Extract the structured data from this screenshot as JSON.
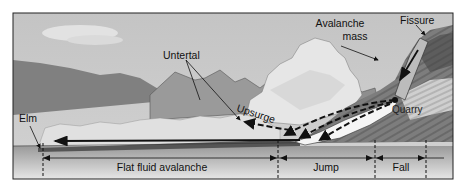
{
  "diagram": {
    "labels": {
      "untertal": "Untertal",
      "avalanche_mass_line1": "Avalanche",
      "avalanche_mass_line2": "mass",
      "fissure": "Fissure",
      "upsurge": "Upsurge",
      "quarry": "Quarry",
      "elm": "Elm"
    },
    "segments": [
      {
        "label": "Flat fluid avalanche"
      },
      {
        "label": "Jump"
      },
      {
        "label": "Fall"
      }
    ],
    "colors": {
      "sky": "#c9c9c9",
      "far_hills": "#8a8a8a",
      "mid_mountains": "#9c9c9c",
      "ground": "#b5b5b5",
      "cloud": "#eeeeee",
      "frame": "#222222"
    }
  }
}
